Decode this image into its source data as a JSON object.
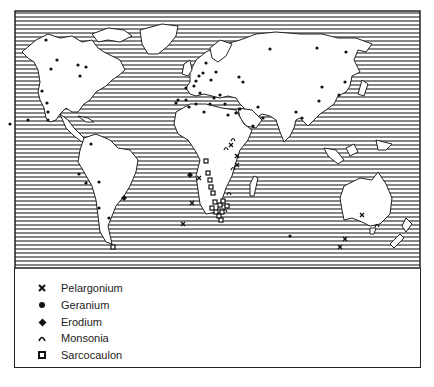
{
  "map": {
    "title": "World distribution of Geraniaceae genera",
    "hatch_spacing_px": 4,
    "colors": {
      "ocean_hatch": "#222222",
      "land": "#ffffff",
      "border": "#222222",
      "marker": "#111111"
    }
  },
  "legend": {
    "items": [
      {
        "symbol": "cross",
        "label": "Pelargonium"
      },
      {
        "symbol": "dot",
        "label": "Geranium"
      },
      {
        "symbol": "diamond-dot",
        "label": "Erodium"
      },
      {
        "symbol": "arc",
        "label": "Monsonia"
      },
      {
        "symbol": "square",
        "label": "Sarcocaulon"
      }
    ]
  },
  "markers": {
    "Geranium": [
      [
        46,
        40
      ],
      [
        57,
        60
      ],
      [
        51,
        69
      ],
      [
        78,
        65
      ],
      [
        86,
        67
      ],
      [
        80,
        76
      ],
      [
        42,
        91
      ],
      [
        47,
        103
      ],
      [
        48,
        112
      ],
      [
        48,
        120
      ],
      [
        28,
        120
      ],
      [
        10,
        124
      ],
      [
        91,
        144
      ],
      [
        79,
        174
      ],
      [
        86,
        183
      ],
      [
        99,
        182
      ],
      [
        99,
        208
      ],
      [
        109,
        218
      ],
      [
        270,
        49
      ],
      [
        317,
        48
      ],
      [
        346,
        52
      ],
      [
        345,
        82
      ],
      [
        322,
        87
      ],
      [
        319,
        101
      ],
      [
        258,
        107
      ],
      [
        296,
        112
      ],
      [
        302,
        118
      ],
      [
        214,
        98
      ],
      [
        203,
        73
      ],
      [
        196,
        81
      ],
      [
        211,
        80
      ],
      [
        186,
        88
      ],
      [
        194,
        86
      ],
      [
        178,
        100
      ],
      [
        176,
        103
      ],
      [
        186,
        100
      ],
      [
        210,
        104
      ],
      [
        225,
        104
      ],
      [
        189,
        107
      ],
      [
        204,
        112
      ],
      [
        196,
        104
      ],
      [
        200,
        93
      ],
      [
        220,
        95
      ],
      [
        240,
        109
      ],
      [
        236,
        113
      ],
      [
        199,
        76
      ],
      [
        206,
        63
      ],
      [
        216,
        72
      ],
      [
        239,
        77
      ],
      [
        243,
        82
      ],
      [
        228,
        115
      ],
      [
        263,
        118
      ],
      [
        339,
        95
      ],
      [
        290,
        236
      ],
      [
        253,
        126
      ]
    ],
    "Pelargonium": [
      [
        362,
        215
      ],
      [
        345,
        239
      ],
      [
        340,
        247
      ],
      [
        199,
        178
      ],
      [
        192,
        203
      ],
      [
        183,
        224
      ],
      [
        231,
        145
      ],
      [
        237,
        156
      ],
      [
        237,
        165
      ]
    ],
    "Erodium": [
      [
        124,
        198
      ],
      [
        190,
        175
      ]
    ],
    "Monsonia": [
      [
        233,
        139
      ],
      [
        226,
        148
      ],
      [
        233,
        168
      ],
      [
        229,
        193
      ],
      [
        225,
        210
      ],
      [
        377,
        225
      ]
    ],
    "Sarcocaulon": [
      [
        206,
        161
      ],
      [
        208,
        173
      ],
      [
        210,
        180
      ],
      [
        211,
        187
      ],
      [
        213,
        193
      ],
      [
        215,
        202
      ],
      [
        212,
        208
      ],
      [
        216,
        212
      ],
      [
        220,
        205
      ],
      [
        222,
        212
      ],
      [
        227,
        206
      ],
      [
        223,
        201
      ],
      [
        219,
        216
      ],
      [
        221,
        220
      ],
      [
        113,
        247
      ]
    ]
  }
}
